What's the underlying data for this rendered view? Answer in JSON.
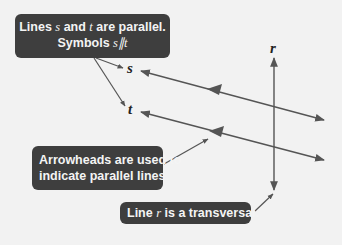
{
  "diagram": {
    "type": "parallel-lines-with-transversal",
    "colors": {
      "background": "#f2f2f2",
      "callout_bg": "#3e3e3e",
      "callout_text": "#f4f4f4",
      "line": "#555555",
      "label": "#222222"
    },
    "labels": {
      "s": "s",
      "t": "t",
      "r": "r"
    },
    "callouts": {
      "parallel": {
        "line1_prefix": "Lines ",
        "line1_s": "s",
        "line1_mid": " and ",
        "line1_t": "t",
        "line1_suffix": " are parallel.",
        "line2_prefix": "Symbols ",
        "line2_symbol": "s∥t"
      },
      "arrowheads": {
        "line1": "Arrowheads are used to",
        "line2": "indicate parallel lines."
      },
      "transversal": {
        "prefix": "Line ",
        "var": "r",
        "suffix": " is a transversal."
      }
    }
  }
}
